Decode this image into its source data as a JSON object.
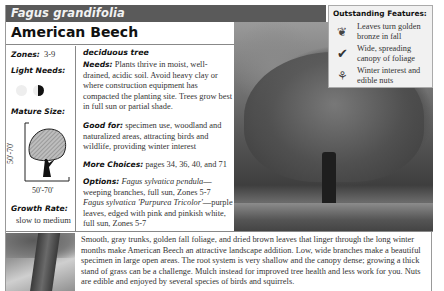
{
  "header": {
    "latin_name": "Fagus grandifolia",
    "common_name": "American Beech"
  },
  "left_column": {
    "zones_label": "Zones:",
    "zones_value": "3-9",
    "light_label": "Light Needs:",
    "light_icons": [
      "full-sun-icon",
      "partial-shade-icon"
    ],
    "mature_size_label": "Mature Size:",
    "height_value": "50'-70'",
    "width_value": "50'-70'",
    "growth_label": "Growth Rate:",
    "growth_value": "slow to medium"
  },
  "middle_column": {
    "plant_type": "deciduous tree",
    "needs_label": "Needs:",
    "needs_text": "Plants thrive in moist, well-drained, acidic soil. Avoid heavy clay or where construction equipment has compacted the planting site. Trees grow best in full sun or partial shade.",
    "good_for_label": "Good for:",
    "good_for_text": "specimen use, woodland and naturalized areas, attracting birds and wildlife, providing winter interest",
    "more_choices_label": "More Choices:",
    "more_choices_text": "pages 34, 36, 40, and 71",
    "options_label": "Options:",
    "option1_name": "Fagus sylvatica pendula",
    "option1_text": "—weeping branches, full sun, Zones 5-7",
    "option2_name": "Fagus sylvatica 'Purpurea Tricolor'",
    "option2_text": "—purple leaves, edged with pink and pinkish white, full sun, Zones 5-7"
  },
  "features": {
    "title": "Outstanding Features:",
    "items": [
      {
        "icon": "leaf-icon",
        "glyph": "❦",
        "text": "Leaves turn golden bronze in fall"
      },
      {
        "icon": "checkmark-icon",
        "glyph": "✔",
        "text": "Wide, spreading canopy of foliage"
      },
      {
        "icon": "twig-icon",
        "glyph": "⚘",
        "text": "Winter interest and edible nuts"
      }
    ]
  },
  "description": "Smooth, gray trunks, golden fall foliage, and dried brown leaves that linger through the long winter months make American Beech an attractive landscape addition. Low, wide branches make a beautiful specimen in large open areas. The root system is very shallow and the canopy dense; growing a thick stand of grass can be a challenge. Mulch instead for improved tree health and less work for you. Nuts are edible and enjoyed by several species of birds and squirrels."
}
